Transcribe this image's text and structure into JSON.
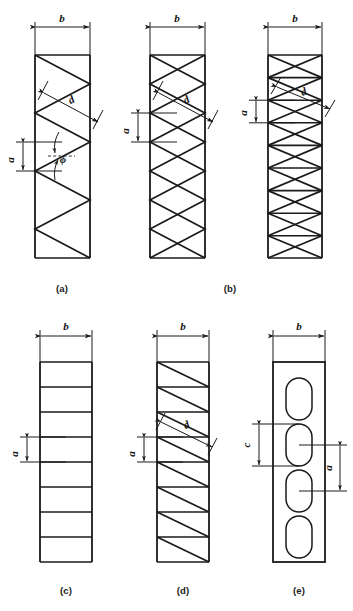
{
  "figure": {
    "background_color": "#ffffff",
    "line_color": "#1a1a1a",
    "panels": [
      {
        "id": "a",
        "caption": "(a)",
        "type": "single-lacing-zigzag",
        "columns": 1,
        "labels": {
          "width": "b",
          "spacing": "a",
          "diagonal": "d",
          "angle": "ϕ"
        }
      },
      {
        "id": "b",
        "caption": "(b)",
        "type": "double-lacing-cross",
        "columns": 2,
        "variants": [
          "cross-lacing-without-battens",
          "cross-lacing-with-battens"
        ],
        "labels": {
          "width": "b",
          "spacing": "a",
          "diagonal": "d"
        }
      },
      {
        "id": "c",
        "caption": "(c)",
        "type": "battened",
        "columns": 1,
        "labels": {
          "width": "b",
          "spacing": "a"
        }
      },
      {
        "id": "d",
        "caption": "(d)",
        "type": "single-diagonal-lacing-with-battens",
        "columns": 1,
        "labels": {
          "width": "b",
          "spacing": "a",
          "diagonal": "d"
        }
      },
      {
        "id": "e",
        "caption": "(e)",
        "type": "perforated-cover-plate",
        "columns": 1,
        "slot_count": 4,
        "labels": {
          "width": "b",
          "spacing": "a",
          "slot_length": "c"
        }
      }
    ],
    "symbols": {
      "b": "b",
      "a": "a",
      "c": "c",
      "d": "d",
      "phi": "ϕ"
    },
    "captions": {
      "a": "(a)",
      "b": "(b)",
      "c": "(c)",
      "d": "(d)",
      "e": "(e)"
    }
  }
}
